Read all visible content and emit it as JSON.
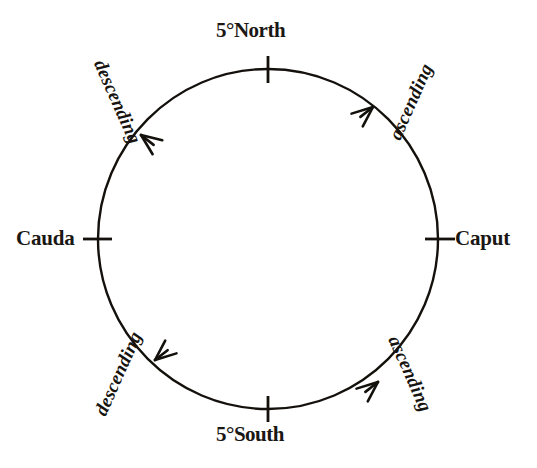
{
  "figure": {
    "type": "lunar-node-cycle-diagram",
    "background_color": "#ffffff",
    "ink_color": "#14110d"
  },
  "circle": {
    "center_x": 268,
    "center_y": 239,
    "radius": 170,
    "stroke_width": 2.4
  },
  "cardinal_points": [
    {
      "id": "north",
      "label": "5°North",
      "angle_deg": 90,
      "tick_orientation": "vertical"
    },
    {
      "id": "caput",
      "label": "Caput",
      "angle_deg": 0,
      "tick_orientation": "horizontal"
    },
    {
      "id": "south",
      "label": "5°South",
      "angle_deg": 270,
      "tick_orientation": "vertical"
    },
    {
      "id": "cauda",
      "label": "Cauda",
      "angle_deg": 180,
      "tick_orientation": "horizontal"
    }
  ],
  "flow_labels": [
    {
      "id": "ascending-ne",
      "label": "ascending",
      "quadrant": "upper-right",
      "rotation_deg": -66
    },
    {
      "id": "descending-nw",
      "label": "descending",
      "quadrant": "upper-left",
      "rotation_deg": 66
    },
    {
      "id": "descending-sw",
      "label": "descending",
      "quadrant": "lower-left",
      "rotation_deg": -66
    },
    {
      "id": "ascending-se",
      "label": "ascending",
      "quadrant": "lower-right",
      "rotation_deg": 66
    }
  ],
  "arrows": [
    {
      "id": "arrow-ne",
      "direction": "counterclockwise",
      "points_toward": "north",
      "angle_on_circle_deg": 52
    },
    {
      "id": "arrow-nw",
      "direction": "counterclockwise",
      "points_toward": "cauda",
      "angle_on_circle_deg": 128
    },
    {
      "id": "arrow-sw",
      "direction": "counterclockwise",
      "points_toward": "south",
      "angle_on_circle_deg": 232
    },
    {
      "id": "arrow-se",
      "direction": "counterclockwise",
      "points_toward": "caput",
      "angle_on_circle_deg": 308
    }
  ]
}
